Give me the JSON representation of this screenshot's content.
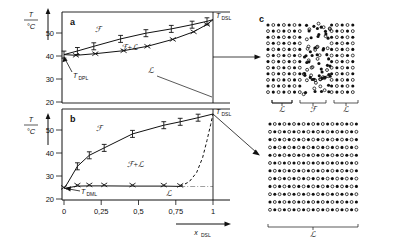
{
  "figure": {
    "panels": [
      "a",
      "b",
      "c"
    ],
    "axis_y_label": "T",
    "axis_y_unit": "°C",
    "axis_x_label": "x",
    "axis_x_sub": "DSL"
  },
  "labels": {
    "panel_a": "a",
    "panel_b": "b",
    "panel_c": "c",
    "fluid": "ℱ",
    "lamellar": "ℒ",
    "two_phase": "ℱ+ℒ",
    "t_dpl": "T",
    "t_dpl_sub": "DPL",
    "t_dml": "T",
    "t_dml_sub": "DML",
    "t_dsl_a": "T",
    "t_dsl_a_sub": "DSL",
    "t_dsl_b": "T",
    "t_dsl_b_sub": "DSL",
    "brace_left": "ℒ",
    "brace_mid": "ℱ",
    "brace_right": "ℒ",
    "brace_bottom": "ℒ"
  },
  "ticks": {
    "y_a": [
      "50",
      "40",
      "30",
      "20"
    ],
    "y_b": [
      "50",
      "40",
      "30",
      "20"
    ],
    "x": [
      "0",
      "0,25",
      "0,5",
      "0,75",
      "1"
    ]
  },
  "chart_data": [
    {
      "type": "line",
      "title": "a",
      "xlabel": "x_DSL",
      "ylabel": "T / °C",
      "xlim": [
        0,
        1
      ],
      "ylim": [
        20,
        57
      ],
      "grid": false,
      "legend": null,
      "annotations": [
        "ℱ",
        "ℱ+ℒ",
        "T_DPL",
        "T_DSL"
      ],
      "series": [
        {
          "name": "liquidus (upper, I markers)",
          "marker": "I",
          "x": [
            0.0,
            0.09,
            0.2,
            0.38,
            0.55,
            0.72,
            0.86,
            0.96,
            1.0
          ],
          "y": [
            40.6,
            42.2,
            44.2,
            47.4,
            49.9,
            51.8,
            53.6,
            55.1,
            55.8
          ]
        },
        {
          "name": "solidus (lower, x markers)",
          "marker": "x",
          "x": [
            0.0,
            0.08,
            0.21,
            0.4,
            0.56,
            0.73,
            0.87,
            0.96,
            1.0
          ],
          "y": [
            40.6,
            40.3,
            41.0,
            42.3,
            44.2,
            47.2,
            50.5,
            53.7,
            55.8
          ]
        }
      ],
      "points_of_interest": [
        {
          "name": "T_DPL",
          "x": 0.0,
          "y": 40.6
        },
        {
          "name": "T_DSL",
          "x": 1.0,
          "y": 55.8
        }
      ]
    },
    {
      "type": "line",
      "title": "b",
      "xlabel": "x_DSL",
      "ylabel": "T / °C",
      "xlim": [
        0,
        1
      ],
      "ylim": [
        20,
        58
      ],
      "grid": false,
      "legend": null,
      "annotations": [
        "ℱ",
        "ℱ+ℒ",
        "ℒ",
        "T_DML",
        "T_DSL"
      ],
      "series": [
        {
          "name": "liquidus (upper, I markers)",
          "marker": "I",
          "x": [
            0.0,
            0.02,
            0.09,
            0.17,
            0.27,
            0.46,
            0.67,
            0.78,
            0.9,
            1.0
          ],
          "y": [
            24.8,
            26.5,
            34.2,
            39.0,
            42.2,
            48.3,
            52.1,
            53.6,
            55.4,
            57.0
          ]
        },
        {
          "name": "solidus (lower, x markers)",
          "marker": "x",
          "x": [
            0.0,
            0.09,
            0.17,
            0.27,
            0.46,
            0.67,
            0.78
          ],
          "y": [
            24.6,
            25.6,
            25.7,
            25.7,
            25.6,
            25.6,
            25.5
          ]
        },
        {
          "name": "metastable boundary (dashed)",
          "marker": "none",
          "style": "dashed",
          "x": [
            0.78,
            0.84,
            0.89,
            0.93,
            0.96,
            0.985,
            1.0
          ],
          "y": [
            25.5,
            27.5,
            31.5,
            38.0,
            45.5,
            52.5,
            57.0
          ]
        }
      ],
      "points_of_interest": [
        {
          "name": "T_DML",
          "x": 0.0,
          "y": 24.7
        },
        {
          "name": "T_DSL",
          "x": 1.0,
          "y": 57.0
        }
      ]
    },
    {
      "type": "scatter",
      "title": "c",
      "subtitle": "lattice schematics",
      "panels": [
        {
          "name": "top: ordered lattice with disordered melt band",
          "cols": 17,
          "rows": 12,
          "disordered_band_cols": [
            7,
            11
          ]
        },
        {
          "name": "bottom: fully ordered mixed lattice",
          "cols": 19,
          "rows": 12,
          "disordered_band_cols": []
        }
      ]
    }
  ],
  "colors": {
    "ink": "#111111",
    "background": "#ffffff"
  }
}
